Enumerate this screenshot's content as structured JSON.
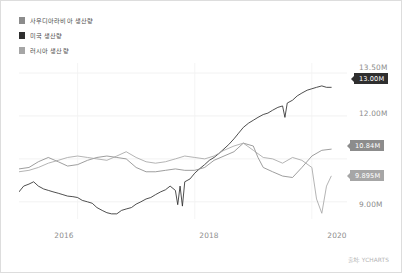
{
  "legend": {
    "items": [
      {
        "label": "사우디아라비아 생산량",
        "color": "#8c8c8c",
        "icon": "square-swatch-icon"
      },
      {
        "label": "미국 생산량",
        "color": "#2f2f2f",
        "icon": "square-swatch-icon"
      },
      {
        "label": "러시아 생산량",
        "color": "#a6a6a6",
        "icon": "square-swatch-icon"
      }
    ]
  },
  "axis": {
    "y_ticks": [
      "13.50M",
      "12.00M",
      "9.00M"
    ],
    "x_ticks": [
      "2016",
      "2018",
      "2020"
    ]
  },
  "badges": {
    "us": "13.00M",
    "saudi": "10.84M",
    "russia": "9.895M"
  },
  "source": "출처: YCHARTS",
  "chart_data": {
    "type": "line",
    "title": "",
    "xlabel": "",
    "ylabel": "",
    "xlim": [
      2015.0,
      2020.6
    ],
    "ylim": [
      8.4,
      13.85
    ],
    "y_gridlines": [
      13.5,
      12.0,
      10.5,
      9.0
    ],
    "y_tick_labels": [
      "13.50M",
      "12.00M",
      "9.00M"
    ],
    "x_tick_values": [
      2016,
      2018,
      2020
    ],
    "x_tick_labels": [
      "2016",
      "2018",
      "2020"
    ],
    "grid": true,
    "legend_position": "top-left",
    "units": "millions of barrels per day",
    "end_labels": {
      "미국 생산량": "13.00M",
      "사우디아라비아 생산량": "10.84M",
      "러시아 생산량": "9.895M"
    },
    "series": [
      {
        "name": "미국 생산량",
        "color": "#2f2f2f",
        "last_value": 13.0,
        "x": [
          2015.0,
          2015.08,
          2015.17,
          2015.25,
          2015.33,
          2015.42,
          2015.5,
          2015.58,
          2015.67,
          2015.75,
          2015.83,
          2015.92,
          2016.0,
          2016.08,
          2016.17,
          2016.25,
          2016.33,
          2016.42,
          2016.5,
          2016.58,
          2016.67,
          2016.75,
          2016.83,
          2016.92,
          2017.0,
          2017.08,
          2017.17,
          2017.25,
          2017.33,
          2017.42,
          2017.5,
          2017.58,
          2017.67,
          2017.71,
          2017.75,
          2017.79,
          2017.83,
          2017.92,
          2018.0,
          2018.08,
          2018.17,
          2018.25,
          2018.33,
          2018.42,
          2018.5,
          2018.58,
          2018.67,
          2018.75,
          2018.83,
          2018.92,
          2019.0,
          2019.08,
          2019.17,
          2019.25,
          2019.33,
          2019.42,
          2019.5,
          2019.54,
          2019.58,
          2019.67,
          2019.75,
          2019.83,
          2019.92,
          2020.0,
          2020.08,
          2020.17,
          2020.25,
          2020.33
        ],
        "y": [
          9.35,
          9.55,
          9.62,
          9.7,
          9.55,
          9.45,
          9.4,
          9.35,
          9.3,
          9.25,
          9.2,
          9.18,
          9.15,
          9.05,
          9.0,
          8.95,
          8.8,
          8.7,
          8.62,
          8.58,
          8.58,
          8.7,
          8.75,
          8.8,
          8.92,
          9.0,
          9.1,
          9.15,
          9.25,
          9.35,
          9.42,
          9.55,
          9.4,
          8.9,
          9.55,
          8.85,
          9.7,
          9.8,
          10.0,
          10.15,
          10.3,
          10.45,
          10.55,
          10.7,
          10.85,
          11.0,
          11.2,
          11.4,
          11.6,
          11.75,
          11.85,
          11.95,
          12.05,
          12.1,
          12.2,
          12.3,
          12.35,
          11.95,
          12.45,
          12.55,
          12.7,
          12.8,
          12.9,
          12.95,
          13.0,
          13.05,
          13.0,
          13.0
        ]
      },
      {
        "name": "사우디아라비아 생산량",
        "color": "#8c8c8c",
        "last_value": 10.84,
        "x": [
          2015.0,
          2015.17,
          2015.33,
          2015.5,
          2015.67,
          2015.83,
          2016.0,
          2016.17,
          2016.33,
          2016.5,
          2016.67,
          2016.83,
          2017.0,
          2017.17,
          2017.33,
          2017.5,
          2017.67,
          2017.83,
          2018.0,
          2018.17,
          2018.33,
          2018.5,
          2018.67,
          2018.83,
          2019.0,
          2019.08,
          2019.17,
          2019.33,
          2019.5,
          2019.67,
          2019.83,
          2020.0,
          2020.17,
          2020.33
        ],
        "y": [
          10.15,
          10.2,
          10.4,
          10.55,
          10.4,
          10.25,
          10.3,
          10.45,
          10.55,
          10.6,
          10.55,
          10.5,
          10.2,
          10.05,
          10.05,
          10.1,
          10.15,
          10.1,
          10.1,
          10.2,
          10.45,
          10.6,
          10.75,
          11.05,
          10.95,
          10.55,
          10.2,
          10.05,
          9.9,
          9.85,
          10.2,
          10.6,
          10.8,
          10.84
        ]
      },
      {
        "name": "러시아 생산량",
        "color": "#a6a6a6",
        "last_value": 9.895,
        "x": [
          2015.0,
          2015.17,
          2015.33,
          2015.5,
          2015.67,
          2015.83,
          2016.0,
          2016.17,
          2016.33,
          2016.5,
          2016.67,
          2016.83,
          2017.0,
          2017.17,
          2017.33,
          2017.5,
          2017.67,
          2017.83,
          2018.0,
          2018.17,
          2018.33,
          2018.5,
          2018.67,
          2018.83,
          2019.0,
          2019.17,
          2019.33,
          2019.5,
          2019.67,
          2019.83,
          2020.0,
          2020.08,
          2020.17,
          2020.25,
          2020.33
        ],
        "y": [
          10.05,
          10.1,
          10.2,
          10.35,
          10.45,
          10.55,
          10.6,
          10.55,
          10.5,
          10.45,
          10.6,
          10.75,
          10.55,
          10.4,
          10.35,
          10.4,
          10.5,
          10.6,
          10.55,
          10.5,
          10.6,
          10.8,
          10.95,
          11.05,
          10.8,
          10.55,
          10.5,
          10.35,
          10.55,
          10.45,
          10.2,
          9.1,
          8.6,
          9.55,
          9.895
        ]
      }
    ]
  }
}
